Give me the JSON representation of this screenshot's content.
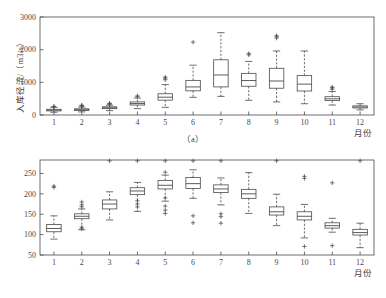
{
  "figure": {
    "background_color": "#ffffff",
    "line_color": "#4a4a4a",
    "panels": [
      {
        "id": "a",
        "caption": "（a）",
        "ylabel": "入库径流/（m3/s）",
        "xlabel": "月份"
      },
      {
        "id": "b",
        "caption": "（b）",
        "ylabel": "发电出力/MW",
        "xlabel": "月份"
      }
    ]
  },
  "chart_data": [
    {
      "type": "box",
      "panel": "a",
      "title": "",
      "xlabel": "月份",
      "ylabel": "入库径流/（m3/s）",
      "categories": [
        "1",
        "2",
        "3",
        "4",
        "5",
        "6",
        "7",
        "8",
        "9",
        "10",
        "11",
        "12"
      ],
      "xticklabels": [
        "1",
        "2",
        "3",
        "4",
        "5",
        "6",
        "7",
        "8",
        "9",
        "10",
        "11",
        "12"
      ],
      "yticks": [
        0,
        1000,
        2000,
        3000
      ],
      "yticklabels": [
        "0",
        "1000",
        "2000",
        "3000"
      ],
      "ylim": [
        0,
        3000
      ],
      "xlim": [
        0.5,
        12.5
      ],
      "grid": false,
      "legend": null,
      "boxes": [
        {
          "category": "1",
          "whisker_low": 85,
          "q1": 125,
          "median": 150,
          "q3": 175,
          "whisker_high": 235,
          "outliers": [
            255,
            265
          ]
        },
        {
          "category": "2",
          "whisker_low": 95,
          "q1": 140,
          "median": 160,
          "q3": 190,
          "whisker_high": 245,
          "outliers": [
            270,
            285,
            300
          ]
        },
        {
          "category": "3",
          "whisker_low": 135,
          "q1": 195,
          "median": 220,
          "q3": 250,
          "whisker_high": 300,
          "outliers": [
            330,
            345,
            360
          ]
        },
        {
          "category": "4",
          "whisker_low": 195,
          "q1": 305,
          "median": 350,
          "q3": 400,
          "whisker_high": 520,
          "outliers": [
            560,
            585
          ]
        },
        {
          "category": "5",
          "whisker_low": 235,
          "q1": 455,
          "median": 545,
          "q3": 650,
          "whisker_high": 930,
          "outliers": [
            1080,
            1130,
            1160
          ]
        },
        {
          "category": "6",
          "whisker_low": 540,
          "q1": 740,
          "median": 860,
          "q3": 1060,
          "whisker_high": 1525,
          "outliers": [
            2230
          ]
        },
        {
          "category": "7",
          "whisker_low": 570,
          "q1": 860,
          "median": 1225,
          "q3": 1690,
          "whisker_high": 2520,
          "outliers": []
        },
        {
          "category": "8",
          "whisker_low": 450,
          "q1": 880,
          "median": 1055,
          "q3": 1275,
          "whisker_high": 1640,
          "outliers": [
            1840,
            1880
          ]
        },
        {
          "category": "9",
          "whisker_low": 400,
          "q1": 820,
          "median": 1040,
          "q3": 1430,
          "whisker_high": 1960,
          "outliers": [
            2355,
            2395,
            2430
          ]
        },
        {
          "category": "10",
          "whisker_low": 345,
          "q1": 735,
          "median": 945,
          "q3": 1205,
          "whisker_high": 1960,
          "outliers": []
        },
        {
          "category": "11",
          "whisker_low": 305,
          "q1": 440,
          "median": 495,
          "q3": 560,
          "whisker_high": 720,
          "outliers": [
            790,
            830,
            855
          ]
        },
        {
          "category": "12",
          "whisker_low": 155,
          "q1": 215,
          "median": 245,
          "q3": 280,
          "whisker_high": 345,
          "outliers": []
        }
      ]
    },
    {
      "type": "box",
      "panel": "b",
      "title": "",
      "xlabel": "月份",
      "ylabel": "发电出力/MW",
      "categories": [
        "1",
        "2",
        "3",
        "4",
        "5",
        "6",
        "7",
        "8",
        "9",
        "10",
        "11",
        "12"
      ],
      "xticklabels": [
        "1",
        "2",
        "3",
        "4",
        "5",
        "6",
        "7",
        "8",
        "9",
        "10",
        "11",
        "12"
      ],
      "yticks": [
        50,
        100,
        150,
        200,
        250
      ],
      "yticklabels": [
        "50",
        "100",
        "150",
        "200",
        "250"
      ],
      "ylim": [
        50,
        283
      ],
      "xlim": [
        0.5,
        12.5
      ],
      "grid": false,
      "legend": null,
      "boxes": [
        {
          "category": "1",
          "whisker_low": 89,
          "q1": 107,
          "median": 115,
          "q3": 125,
          "whisker_high": 146,
          "outliers": [
            216,
            219
          ]
        },
        {
          "category": "2",
          "whisker_low": 112,
          "q1": 139,
          "median": 145,
          "q3": 151,
          "whisker_high": 163,
          "outliers": [
            114,
            118,
            168,
            173,
            180
          ]
        },
        {
          "category": "3",
          "whisker_low": 136,
          "q1": 163,
          "median": 175,
          "q3": 185,
          "whisker_high": 205,
          "outliers": [
            281
          ]
        },
        {
          "category": "4",
          "whisker_low": 157,
          "q1": 198,
          "median": 207,
          "q3": 215,
          "whisker_high": 228,
          "outliers": [
            168,
            175,
            183,
            281
          ]
        },
        {
          "category": "5",
          "whisker_low": 182,
          "q1": 212,
          "median": 221,
          "q3": 233,
          "whisker_high": 246,
          "outliers": [
            152,
            160,
            170,
            190,
            253,
            281
          ]
        },
        {
          "category": "6",
          "whisker_low": 189,
          "q1": 213,
          "median": 225,
          "q3": 240,
          "whisker_high": 259,
          "outliers": [
            129,
            146,
            281
          ]
        },
        {
          "category": "7",
          "whisker_low": 173,
          "q1": 203,
          "median": 212,
          "q3": 222,
          "whisker_high": 239,
          "outliers": [
            128,
            144,
            151,
            281
          ]
        },
        {
          "category": "8",
          "whisker_low": 152,
          "q1": 189,
          "median": 200,
          "q3": 211,
          "whisker_high": 252,
          "outliers": []
        },
        {
          "category": "9",
          "whisker_low": 122,
          "q1": 148,
          "median": 156,
          "q3": 168,
          "whisker_high": 199,
          "outliers": [
            281
          ]
        },
        {
          "category": "10",
          "whisker_low": 92,
          "q1": 136,
          "median": 145,
          "q3": 156,
          "whisker_high": 174,
          "outliers": [
            71,
            238,
            243
          ]
        },
        {
          "category": "11",
          "whisker_low": 106,
          "q1": 116,
          "median": 122,
          "q3": 129,
          "whisker_high": 140,
          "outliers": [
            73,
            227
          ]
        },
        {
          "category": "12",
          "whisker_low": 68,
          "q1": 99,
          "median": 105,
          "q3": 113,
          "whisker_high": 128,
          "outliers": [
            281
          ]
        }
      ]
    }
  ]
}
